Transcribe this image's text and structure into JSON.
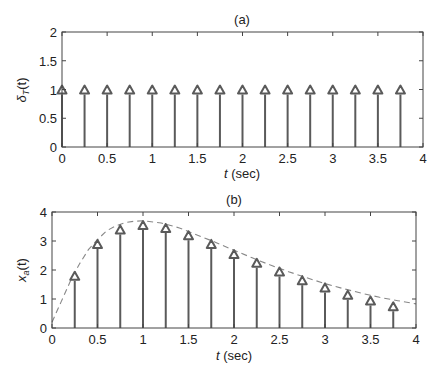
{
  "chart_data": [
    {
      "type": "stem",
      "title": "(a)",
      "xlabel": "t (sec)",
      "xlabel_italic": "t",
      "xlabel_unit": "(sec)",
      "ylabel": "δT(t)",
      "ylabel_base": "δ",
      "ylabel_sub": "T",
      "ylabel_arg": "(t)",
      "xlim": [
        0,
        4
      ],
      "ylim": [
        0,
        2
      ],
      "xticks": [
        0,
        0.5,
        1,
        1.5,
        2,
        2.5,
        3,
        3.5,
        4
      ],
      "xtick_labels": [
        "0",
        "0.5",
        "1",
        "1.5",
        "2",
        "2.5",
        "3",
        "3.5",
        "4"
      ],
      "yticks": [
        0,
        0.5,
        1,
        1.5,
        2
      ],
      "ytick_labels": [
        "0",
        "0.5",
        "1",
        "1.5",
        "2"
      ],
      "grid": false,
      "marker": "triangle-up",
      "x": [
        0,
        0.25,
        0.5,
        0.75,
        1.0,
        1.25,
        1.5,
        1.75,
        2.0,
        2.25,
        2.5,
        2.75,
        3.0,
        3.25,
        3.5,
        3.75
      ],
      "values": [
        1,
        1,
        1,
        1,
        1,
        1,
        1,
        1,
        1,
        1,
        1,
        1,
        1,
        1,
        1,
        1
      ]
    },
    {
      "type": "stem",
      "title": "(b)",
      "xlabel": "t (sec)",
      "xlabel_italic": "t",
      "xlabel_unit": "(sec)",
      "ylabel": "xa(t)",
      "ylabel_base": "x",
      "ylabel_sub": "a",
      "ylabel_arg": "(t)",
      "xlim": [
        0,
        4
      ],
      "ylim": [
        0,
        4
      ],
      "xticks": [
        0,
        0.5,
        1,
        1.5,
        2,
        2.5,
        3,
        3.5,
        4
      ],
      "xtick_labels": [
        "0",
        "0.5",
        "1",
        "1.5",
        "2",
        "2.5",
        "3",
        "3.5",
        "4"
      ],
      "yticks": [
        0,
        1,
        2,
        3,
        4
      ],
      "ytick_labels": [
        "0",
        "1",
        "2",
        "3",
        "4"
      ],
      "grid": false,
      "marker": "triangle-up",
      "x": [
        0.25,
        0.5,
        0.75,
        1.0,
        1.25,
        1.5,
        1.75,
        2.0,
        2.25,
        2.5,
        2.75,
        3.0,
        3.25,
        3.5,
        3.75
      ],
      "values": [
        1.8,
        2.9,
        3.4,
        3.55,
        3.45,
        3.2,
        2.9,
        2.55,
        2.25,
        1.95,
        1.65,
        1.4,
        1.15,
        0.95,
        0.75
      ],
      "envelope": {
        "style": "dashed",
        "description": "continuous signal xa(t) peaking ~3.7 near t=1",
        "x": [
          0,
          0.1,
          0.2,
          0.3,
          0.4,
          0.5,
          0.6,
          0.7,
          0.8,
          0.9,
          1.0,
          1.2,
          1.4,
          1.6,
          1.8,
          2.0,
          2.2,
          2.4,
          2.6,
          2.8,
          3.0,
          3.2,
          3.4,
          3.6,
          3.8,
          4.0
        ],
        "y": [
          0.2,
          0.9,
          1.6,
          2.2,
          2.7,
          3.05,
          3.35,
          3.52,
          3.63,
          3.68,
          3.7,
          3.62,
          3.45,
          3.2,
          2.95,
          2.68,
          2.42,
          2.17,
          1.94,
          1.73,
          1.53,
          1.36,
          1.2,
          1.06,
          0.94,
          0.83
        ]
      }
    }
  ],
  "style": {
    "stem_color": "#5a5a5a",
    "axis_color": "#444444",
    "envelope_color": "#888888"
  }
}
